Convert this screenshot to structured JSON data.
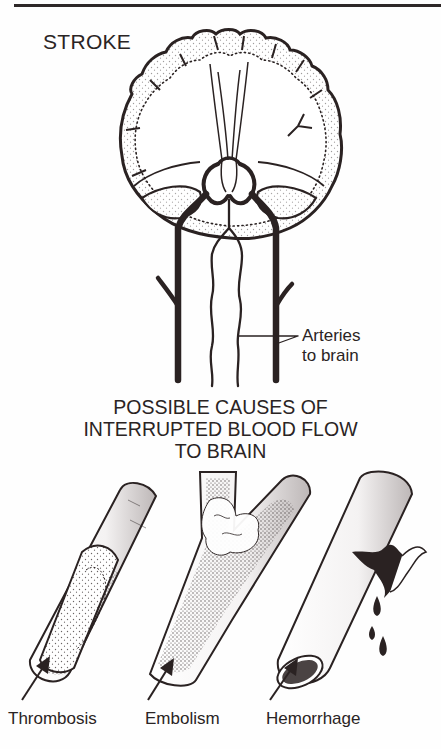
{
  "figure": {
    "title": "STROKE",
    "brain_label": {
      "line1": "Arteries",
      "line2": "to brain"
    },
    "causes_heading": {
      "line1": "POSSIBLE CAUSES OF",
      "line2": "INTERRUPTED BLOOD FLOW",
      "line3": "TO BRAIN"
    },
    "causes": [
      {
        "label": "Thrombosis"
      },
      {
        "label": "Embolism"
      },
      {
        "label": "Hemorrhage"
      }
    ]
  },
  "colors": {
    "ink": "#2a2222",
    "background": "#fefefe"
  }
}
